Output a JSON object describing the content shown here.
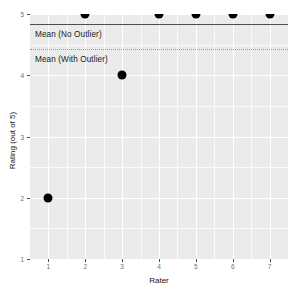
{
  "chart_data": {
    "type": "scatter",
    "title": "",
    "xlabel": "Rater",
    "ylabel": "Rating (out of 5)",
    "x": [
      1,
      2,
      3,
      4,
      5,
      6,
      7
    ],
    "values": [
      2,
      5,
      4,
      5,
      5,
      5,
      5
    ],
    "series": [
      {
        "name": "Rating",
        "values": [
          2,
          5,
          4,
          5,
          5,
          5,
          5
        ]
      }
    ],
    "xlim": [
      0.5,
      7.5
    ],
    "ylim": [
      1,
      5
    ],
    "x_ticks": [
      "1",
      "2",
      "3",
      "4",
      "5",
      "6",
      "7"
    ],
    "y_ticks": [
      "1",
      "2",
      "3",
      "4",
      "5"
    ],
    "grid": true,
    "legend": "none",
    "point_color": "#000000",
    "panel_color": "#ebebeb",
    "annotations": [
      {
        "label": "Mean (No Outlier)",
        "value": 4.83,
        "style": "solid",
        "color": "#4d4d4d"
      },
      {
        "label": "Mean (With Outlier)",
        "value": 4.43,
        "style": "dotted",
        "color": "#9a9a9a"
      }
    ],
    "reference_lines": [
      {
        "name": "mean-no-outlier",
        "y": 4.83,
        "style": "solid"
      },
      {
        "name": "mean-with-outlier",
        "y": 4.43,
        "style": "dotted"
      }
    ]
  }
}
